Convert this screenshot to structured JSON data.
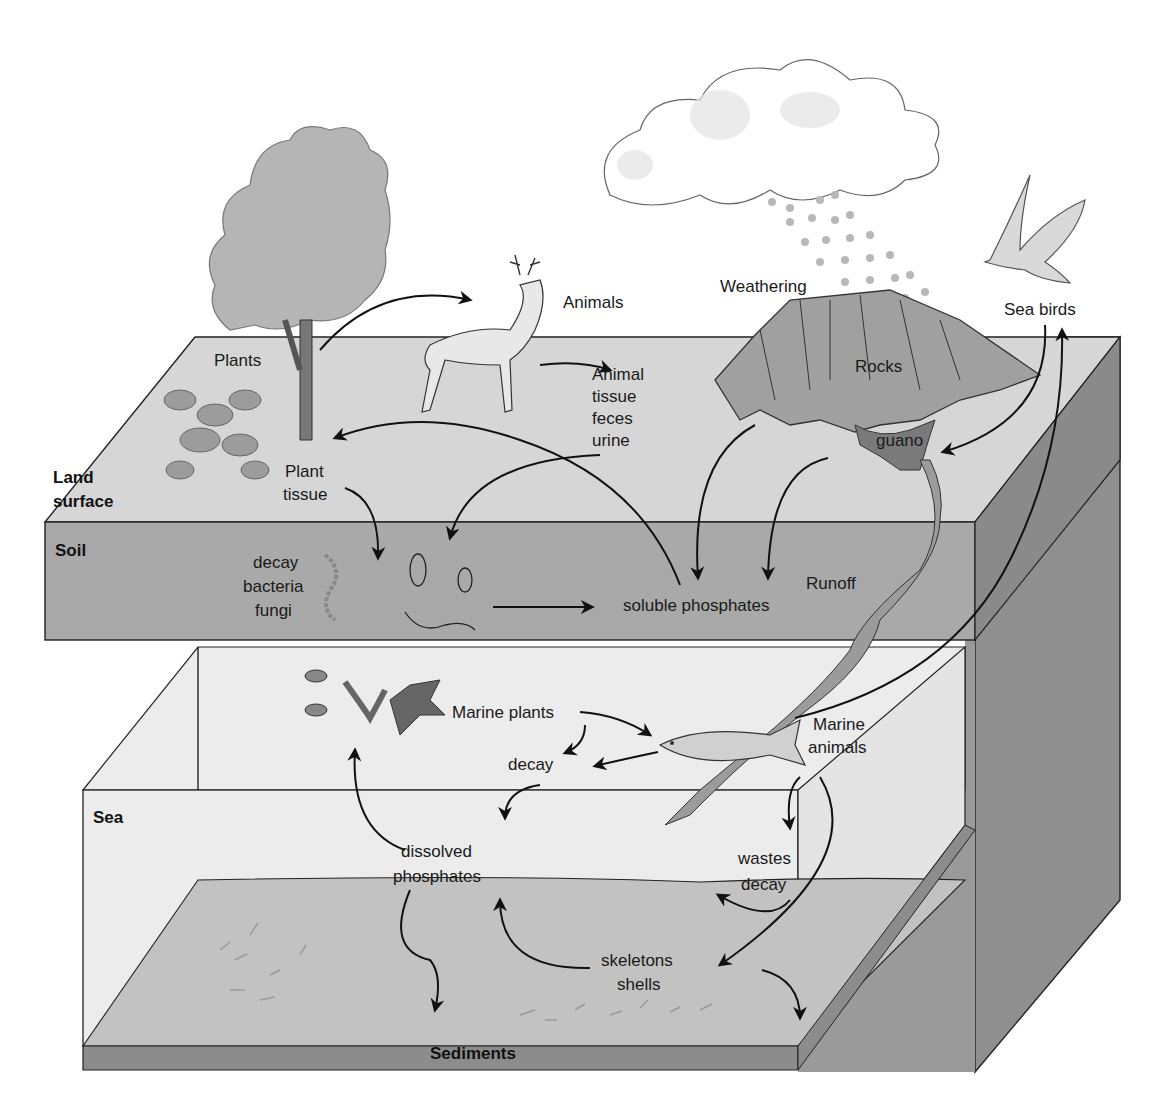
{
  "diagram": {
    "type": "phosphorus-cycle",
    "layers": {
      "land_surface": "Land surface",
      "land_surface_line1": "Land",
      "land_surface_line2": "surface",
      "soil": "Soil",
      "sea": "Sea",
      "sediments": "Sediments"
    },
    "labels": {
      "plants": "Plants",
      "animals": "Animals",
      "animal_waste_1": "Animal",
      "animal_waste_2": "tissue",
      "animal_waste_3": "feces",
      "animal_waste_4": "urine",
      "plant_tissue_1": "Plant",
      "plant_tissue_2": "tissue",
      "decomposers_1": "decay",
      "decomposers_2": "bacteria",
      "decomposers_3": "fungi",
      "soluble_phosphates": "soluble phosphates",
      "weathering": "Weathering",
      "rocks": "Rocks",
      "guano": "guano",
      "sea_birds": "Sea birds",
      "runoff": "Runoff",
      "marine_plants": "Marine plants",
      "marine_decay": "decay",
      "marine_animals_1": "Marine",
      "marine_animals_2": "animals",
      "dissolved_phosphates_1": "dissolved",
      "dissolved_phosphates_2": "phosphates",
      "wastes_decay_1": "wastes",
      "wastes_decay_2": "decay",
      "skeletons_shells_1": "skeletons",
      "skeletons_shells_2": "shells"
    },
    "colors": {
      "land_surface": "#d6d6d6",
      "soil": "#a9a9a9",
      "sea_water": "#ececec",
      "sea_floor": "#bfbfbf",
      "sediments": "#8c8c8c",
      "box_side": "#8f8f8f",
      "rock": "#a0a0a0",
      "guano": "#7a7a7a",
      "runoff": "#9b9b9b",
      "tree": "#b5b5b5",
      "rain": "#b8b8b8"
    }
  }
}
